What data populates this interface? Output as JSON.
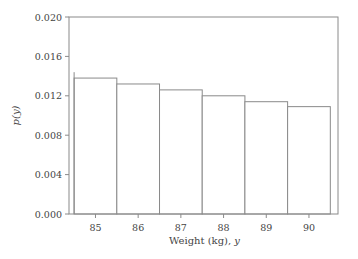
{
  "chart_data": {
    "type": "bar",
    "title": "",
    "xlabel": "Weight (kg), ",
    "xlabel_var": "y",
    "ylabel": "p(y)",
    "categories": [
      "85",
      "86",
      "87",
      "88",
      "89",
      "90"
    ],
    "x": [
      85,
      86,
      87,
      88,
      89,
      90
    ],
    "values": [
      0.0138,
      0.0132,
      0.0126,
      0.012,
      0.0114,
      0.0109
    ],
    "bar_width": 1,
    "xlim": [
      84.38,
      90.68
    ],
    "ylim": [
      0,
      0.02
    ],
    "yticks": [
      0.0,
      0.004,
      0.008,
      0.012,
      0.016,
      0.02
    ],
    "ytick_labels": [
      "0.000",
      "0.004",
      "0.008",
      "0.012",
      "0.016",
      "0.020"
    ],
    "xtick_labels": [
      "85",
      "86",
      "87",
      "88",
      "89",
      "90"
    ],
    "left_edge_marker": {
      "x": 84.5,
      "y": 0.0144
    },
    "grid": false,
    "legend": "none"
  },
  "colors": {
    "axis": "#8a8a8a",
    "bar_fill": "#ffffff",
    "text": "#444444"
  }
}
